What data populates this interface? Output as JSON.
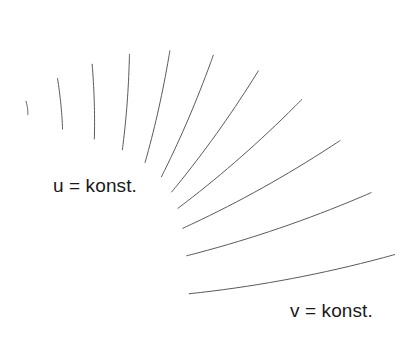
{
  "figure": {
    "background_color": "#ffffff",
    "width": 409,
    "height": 338
  },
  "labels": {
    "u_label": "u = konst.",
    "v_label": "v = konst."
  },
  "mesh": {
    "line_color": "#5a5a5a",
    "line_width": 1,
    "u_curve_count": 9,
    "v_curve_count": 11,
    "description": "Parametric surface patch drawn as two families of intersecting curves; u-family runs lengthwise, v-family runs crosswise. Curve ends overshoot the patch boundary slightly.",
    "overshoot": 0.035,
    "corners": {
      "top_left": [
        122,
        18
      ],
      "left_tail": [
        27,
        88
      ],
      "right_top": [
        283,
        44
      ],
      "right_bottom": [
        360,
        246
      ],
      "bottom_tip": [
        218,
        298
      ]
    },
    "patch_control_grid": [
      [
        [
          27,
          84
        ],
        [
          78,
          70
        ],
        [
          128,
          52
        ],
        [
          180,
          38
        ],
        [
          228,
          30
        ],
        [
          268,
          31
        ],
        [
          300,
          45
        ],
        [
          322,
          70
        ],
        [
          336,
          102
        ]
      ],
      [
        [
          27,
          90
        ],
        [
          79,
          79
        ],
        [
          131,
          65
        ],
        [
          184,
          52
        ],
        [
          233,
          46
        ],
        [
          274,
          49
        ],
        [
          307,
          64
        ],
        [
          330,
          90
        ],
        [
          345,
          124
        ]
      ],
      [
        [
          30,
          99
        ],
        [
          83,
          92
        ],
        [
          137,
          82
        ],
        [
          190,
          72
        ],
        [
          240,
          68
        ],
        [
          282,
          72
        ],
        [
          316,
          89
        ],
        [
          340,
          117
        ],
        [
          355,
          153
        ]
      ],
      [
        [
          36,
          110
        ],
        [
          90,
          108
        ],
        [
          145,
          102
        ],
        [
          199,
          96
        ],
        [
          249,
          95
        ],
        [
          292,
          101
        ],
        [
          326,
          120
        ],
        [
          351,
          150
        ],
        [
          366,
          188
        ]
      ],
      [
        [
          45,
          124
        ],
        [
          100,
          127
        ],
        [
          156,
          125
        ],
        [
          210,
          124
        ],
        [
          261,
          127
        ],
        [
          304,
          136
        ],
        [
          338,
          157
        ],
        [
          363,
          189
        ],
        [
          378,
          229
        ]
      ],
      [
        [
          57,
          141
        ],
        [
          113,
          149
        ],
        [
          169,
          152
        ],
        [
          224,
          156
        ],
        [
          275,
          163
        ],
        [
          318,
          175
        ],
        [
          352,
          199
        ],
        [
          377,
          233
        ],
        [
          392,
          275
        ]
      ]
    ],
    "note": "The control grid above is a coarse guide; the rendered net is generated as smooth bent curves sweeping from the narrow left tail to the broad lower-right end."
  }
}
